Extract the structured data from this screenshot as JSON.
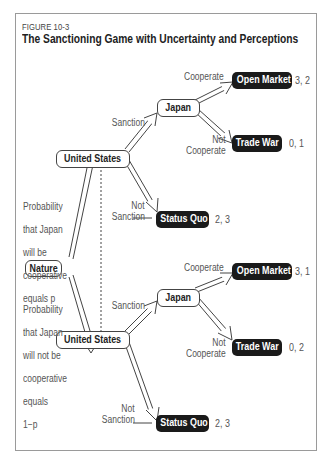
{
  "figure": {
    "label": "FIGURE 10-3",
    "title": "The Sanctioning Game with Uncertainty and Perceptions"
  },
  "nodes": {
    "nature": "Nature",
    "us_top": "United States",
    "us_bottom": "United States",
    "japan_top": "Japan",
    "japan_bottom": "Japan"
  },
  "outcomes": {
    "top": {
      "open_market": {
        "label": "Open Market",
        "payoff": "3, 2"
      },
      "trade_war": {
        "label": "Trade War",
        "payoff": "0, 1"
      },
      "status_quo": {
        "label": "Status Quo",
        "payoff": "2, 3"
      }
    },
    "bottom": {
      "open_market": {
        "label": "Open Market",
        "payoff": "3, 1"
      },
      "trade_war": {
        "label": "Trade War",
        "payoff": "0, 2"
      },
      "status_quo": {
        "label": "Status Quo",
        "payoff": "2, 3"
      }
    }
  },
  "branch_labels": {
    "top": {
      "sanction": "Sanction",
      "not_sanction_1": "Not",
      "not_sanction_2": "Sanction",
      "cooperate": "Cooperate",
      "not_cooperate_1": "Not",
      "not_cooperate_2": "Cooperate"
    },
    "bottom": {
      "sanction": "Sanction",
      "not_sanction_1": "Not",
      "not_sanction_2": "Sanction",
      "cooperate": "Cooperate",
      "not_cooperate_1": "Not",
      "not_cooperate_2": "Cooperate"
    }
  },
  "probabilities": {
    "cooperative": [
      "Probability",
      "that Japan",
      "will be",
      "cooperative",
      "equals p"
    ],
    "not_cooperative": [
      "Probability",
      "that Japan",
      "will not be",
      "cooperative",
      "equals",
      "1−p"
    ]
  }
}
